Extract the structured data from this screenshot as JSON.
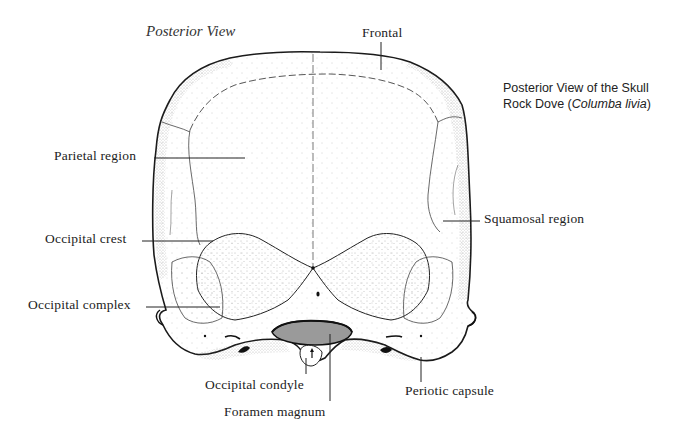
{
  "diagram": {
    "view_title": "Posterior View",
    "caption": {
      "line1": "Posterior View of the Skull",
      "line2_prefix": "Rock Dove (",
      "line2_species": "Columba livia",
      "line2_suffix": ")"
    },
    "colors": {
      "outline": "#1a1a1a",
      "stipple": "#555555",
      "foramen_fill": "#9a9a9a",
      "background": "#ffffff",
      "label_text": "#222222"
    },
    "labels": [
      {
        "id": "frontal",
        "text": "Frontal"
      },
      {
        "id": "parietal-region",
        "text": "Parietal region"
      },
      {
        "id": "squamosal-region",
        "text": "Squamosal region"
      },
      {
        "id": "occipital-crest",
        "text": "Occipital crest"
      },
      {
        "id": "occipital-complex",
        "text": "Occipital complex"
      },
      {
        "id": "occipital-condyle",
        "text": "Occipital condyle"
      },
      {
        "id": "foramen-magnum",
        "text": "Foramen magnum"
      },
      {
        "id": "periotic-capsule",
        "text": "Periotic capsule"
      }
    ]
  }
}
